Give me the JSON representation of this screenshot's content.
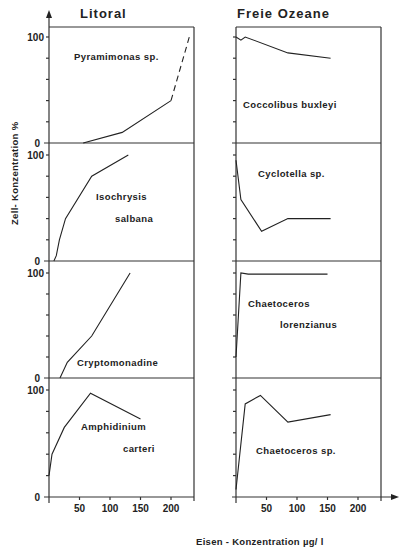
{
  "columns": [
    {
      "title": "Litoral"
    },
    {
      "title": "Freie Ozeane"
    }
  ],
  "y_axis_label": "Zell- Konzentration  %",
  "x_axis_label": "Eisen - Konzentration    µg/ l",
  "y_tick_labels": {
    "top": "100",
    "bottom": "0"
  },
  "x_tick_labels": [
    "50",
    "100",
    "150",
    "200"
  ],
  "panels": [
    {
      "column": 0,
      "row": 0,
      "species": [
        "Pyramimonas  sp."
      ]
    },
    {
      "column": 1,
      "row": 0,
      "species": [
        "Coccolibus  buxleyi"
      ]
    },
    {
      "column": 0,
      "row": 1,
      "species": [
        "Isochrysis",
        "salbana"
      ]
    },
    {
      "column": 1,
      "row": 1,
      "species": [
        "Cyclotella  sp."
      ]
    },
    {
      "column": 0,
      "row": 2,
      "species": [
        "Cryptomonadine"
      ]
    },
    {
      "column": 1,
      "row": 2,
      "species": [
        "Chaetoceros",
        "lorenzianus"
      ]
    },
    {
      "column": 0,
      "row": 3,
      "species": [
        "Amphidinium",
        "carteri"
      ]
    },
    {
      "column": 1,
      "row": 3,
      "species": [
        "Chaetoceros  sp."
      ]
    }
  ],
  "chart_data": {
    "type": "line",
    "title": "",
    "xlabel": "Eisen - Konzentration µg/l",
    "ylabel": "Zell- Konzentration %",
    "xlim": [
      0,
      230
    ],
    "ylim": [
      0,
      100
    ],
    "x_ticks": [
      50,
      100,
      150,
      200
    ],
    "y_ticks": [
      0,
      100
    ],
    "grid": false,
    "layout": "small multiples 4 rows x 2 columns (Litoral | Freie Ozeane)",
    "series": [
      {
        "name": "Pyramimonas sp.",
        "group": "Litoral",
        "points": [
          [
            56,
            0
          ],
          [
            120,
            10
          ],
          [
            200,
            40
          ]
        ],
        "dashed_extension": [
          [
            200,
            40
          ],
          [
            230,
            100
          ]
        ]
      },
      {
        "name": "Coccolibus buxleyi",
        "group": "Freie Ozeane",
        "points": [
          [
            0,
            100
          ],
          [
            8,
            97
          ],
          [
            15,
            100
          ],
          [
            85,
            85
          ],
          [
            155,
            80
          ]
        ]
      },
      {
        "name": "Isochrysis salbana",
        "group": "Litoral",
        "points": [
          [
            8,
            0
          ],
          [
            12,
            5
          ],
          [
            17,
            20
          ],
          [
            27,
            40
          ],
          [
            70,
            80
          ],
          [
            130,
            100
          ]
        ]
      },
      {
        "name": "Cyclotella sp.",
        "group": "Freie Ozeane",
        "points": [
          [
            0,
            95
          ],
          [
            8,
            58
          ],
          [
            42,
            28
          ],
          [
            85,
            40
          ],
          [
            155,
            40
          ]
        ]
      },
      {
        "name": "Cryptomonadine",
        "group": "Litoral",
        "points": [
          [
            18,
            0
          ],
          [
            30,
            15
          ],
          [
            70,
            40
          ],
          [
            133,
            100
          ]
        ]
      },
      {
        "name": "Chaetoceros lorenzianus",
        "group": "Freie Ozeane",
        "points": [
          [
            0,
            20
          ],
          [
            8,
            100
          ],
          [
            20,
            99
          ],
          [
            150,
            99
          ]
        ]
      },
      {
        "name": "Amphidinium carteri",
        "group": "Litoral",
        "points": [
          [
            0,
            20
          ],
          [
            5,
            40
          ],
          [
            25,
            65
          ],
          [
            68,
            97
          ],
          [
            150,
            73
          ]
        ]
      },
      {
        "name": "Chaetoceros sp.",
        "group": "Freie Ozeane",
        "points": [
          [
            0,
            7
          ],
          [
            15,
            87
          ],
          [
            40,
            95
          ],
          [
            85,
            70
          ],
          [
            155,
            77
          ]
        ]
      }
    ]
  }
}
